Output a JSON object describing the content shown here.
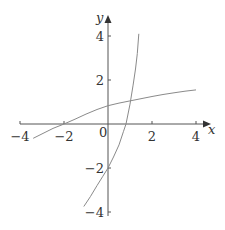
{
  "chart_data": {
    "type": "line",
    "title": "",
    "xlabel": "x",
    "ylabel": "y",
    "xlim": [
      -4,
      4
    ],
    "ylim": [
      -4,
      4
    ],
    "grid": false,
    "origin_label": "0",
    "x_ticks": [
      {
        "value": -4,
        "label": "−4"
      },
      {
        "value": -2,
        "label": "−2"
      },
      {
        "value": 2,
        "label": "2"
      },
      {
        "value": 4,
        "label": "4"
      }
    ],
    "y_ticks": [
      {
        "value": 4,
        "label": "4"
      },
      {
        "value": 2,
        "label": "2"
      },
      {
        "value": -2,
        "label": "−2"
      },
      {
        "value": -4,
        "label": "−4"
      }
    ],
    "series": [
      {
        "name": "flat-curve",
        "points": [
          [
            -3.4,
            -0.65
          ],
          [
            -3,
            -0.45
          ],
          [
            -2.5,
            -0.2
          ],
          [
            -2,
            0
          ],
          [
            -1.5,
            0.22
          ],
          [
            -1,
            0.45
          ],
          [
            -0.5,
            0.66
          ],
          [
            0,
            0.83
          ],
          [
            0.5,
            0.95
          ],
          [
            1,
            1.05
          ],
          [
            1.5,
            1.15
          ],
          [
            2,
            1.25
          ],
          [
            2.5,
            1.34
          ],
          [
            3,
            1.42
          ],
          [
            3.5,
            1.49
          ],
          [
            4,
            1.55
          ]
        ]
      },
      {
        "name": "steep-curve",
        "points": [
          [
            -1.1,
            -3.75
          ],
          [
            -0.8,
            -3.3
          ],
          [
            -0.5,
            -2.8
          ],
          [
            -0.25,
            -2.4
          ],
          [
            0,
            -2
          ],
          [
            0.25,
            -1.5
          ],
          [
            0.5,
            -0.95
          ],
          [
            0.7,
            -0.35
          ],
          [
            0.82,
            0
          ],
          [
            1,
            0.9
          ],
          [
            1.14,
            1.77
          ],
          [
            1.25,
            2.5
          ],
          [
            1.33,
            3.2
          ],
          [
            1.4,
            4.1
          ]
        ]
      }
    ]
  }
}
